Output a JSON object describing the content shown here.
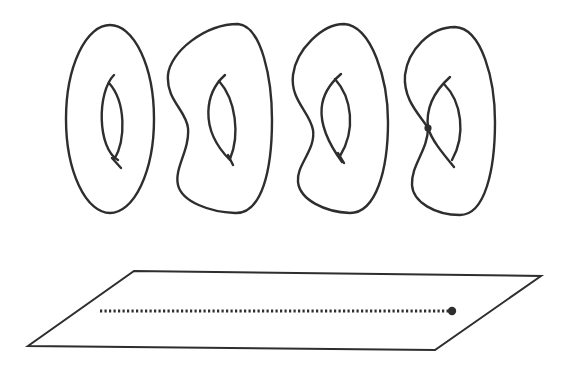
{
  "figure": {
    "colors": {
      "stroke": "#2e2e2e",
      "background": "#ffffff"
    },
    "fibers": [
      {
        "id": "torus-1",
        "kind": "smooth torus (ellipse)"
      },
      {
        "id": "torus-2",
        "kind": "smooth deformed torus"
      },
      {
        "id": "torus-3",
        "kind": "smooth deformed torus"
      },
      {
        "id": "torus-4",
        "kind": "singular torus with node",
        "singular_point": true
      }
    ],
    "base": {
      "kind": "plane (parallelogram)",
      "path": "dotted line",
      "endpoint": "marked point"
    }
  }
}
